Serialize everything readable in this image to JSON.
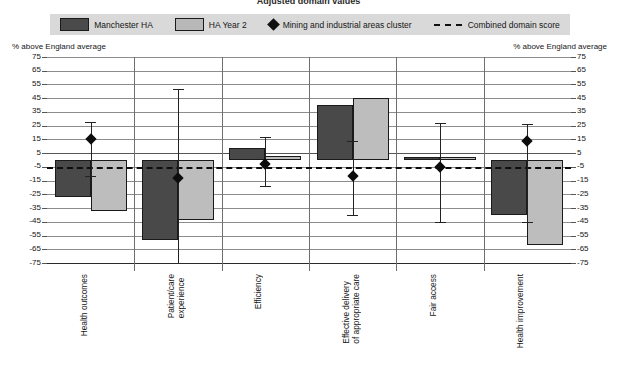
{
  "title": "Adjusted domain values",
  "legend": {
    "position": "top",
    "items": [
      {
        "label": "Manchester HA",
        "icon": "dark-square-swatch",
        "type": "bar",
        "color": "#494949"
      },
      {
        "label": "HA Year 2",
        "icon": "light-square-swatch",
        "type": "bar",
        "color": "#bdbdbd"
      },
      {
        "label": "Mining and industrial areas cluster",
        "icon": "diamond-marker",
        "type": "marker",
        "color": "#0d0d0d"
      },
      {
        "label": "Combined domain score",
        "icon": "dashed-line",
        "type": "line",
        "color": "#0d0d0d"
      }
    ]
  },
  "axis_caption_left": "% above England average",
  "axis_caption_right": "% above England average",
  "chart_data": {
    "type": "bar",
    "title": "Adjusted domain values",
    "xlabel": "",
    "ylabel": "% above England average",
    "ylim": [
      -75,
      75
    ],
    "ytick_step": 10,
    "yticks": [
      75,
      65,
      55,
      45,
      35,
      25,
      15,
      5,
      -5,
      -15,
      -25,
      -35,
      -45,
      -55,
      -65,
      -75
    ],
    "grid": true,
    "legend_position": "top",
    "categories": [
      "Health outcomes",
      "Patient/care\nexperience",
      "Efficiency",
      "Effective delivery\nof appropriate care",
      "Fair access",
      "Health improvement"
    ],
    "series": [
      {
        "name": "Manchester HA",
        "color": "#494949",
        "values": [
          -27,
          -58,
          9,
          40,
          2,
          -40
        ]
      },
      {
        "name": "HA Year 2",
        "color": "#bdbdbd",
        "values": [
          -37,
          -44,
          3,
          45,
          2,
          -62
        ]
      },
      {
        "name": "Mining and industrial areas cluster",
        "color": "#0d0d0d",
        "type": "marker-with-error-bars",
        "values": [
          15,
          -13,
          -3,
          -12,
          -5,
          14
        ],
        "error_high": [
          28,
          52,
          17,
          14,
          27,
          26
        ],
        "error_low": [
          -12,
          -75,
          -19,
          -40,
          -45,
          -45
        ]
      }
    ],
    "reference_line": {
      "name": "Combined domain score",
      "value": -5,
      "style": "dashed",
      "color": "#0d0d0d"
    }
  }
}
